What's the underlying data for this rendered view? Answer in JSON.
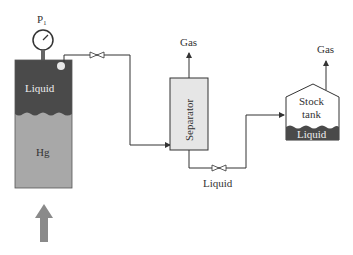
{
  "diagram": {
    "type": "flash liberation process schematic",
    "gauge_label": "P₁",
    "cell": {
      "top_label": "Liquid",
      "bottom_label": "Hg"
    },
    "separator": {
      "label": "Separator",
      "gas_label": "Gas",
      "liquid_label": "Liquid"
    },
    "stock_tank": {
      "label_line1": "Stock",
      "label_line2": "tank",
      "liquid_label": "Liquid",
      "gas_label": "Gas"
    },
    "colors": {
      "liquid": "#4a4a4a",
      "hg": "#a8a8a8",
      "separator": "#e6e6e6",
      "arrow": "#8a8a8a",
      "line": "#333333"
    }
  }
}
